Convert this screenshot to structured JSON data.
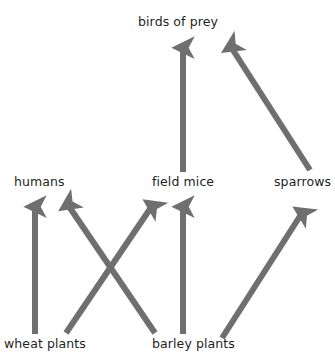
{
  "diagram": {
    "background_color": "#ffffff",
    "arrow_color": "#6f6f6f",
    "text_color": "#231f20",
    "width": 335,
    "height": 360,
    "nodes": [
      {
        "id": "birds_of_prey",
        "label": "birds of prey",
        "x": 183,
        "y": 22,
        "level": "top"
      },
      {
        "id": "humans",
        "label": "humans",
        "x": 41,
        "y": 182,
        "level": "middle"
      },
      {
        "id": "field_mice",
        "label": "field mice",
        "x": 183,
        "y": 182,
        "level": "middle"
      },
      {
        "id": "sparrows",
        "label": "sparrows",
        "x": 302,
        "y": 182,
        "level": "middle"
      },
      {
        "id": "wheat_plants",
        "label": "wheat plants",
        "x": 51,
        "y": 344,
        "level": "bottom"
      },
      {
        "id": "barley_plants",
        "label": "barley plants",
        "x": 198,
        "y": 344,
        "level": "bottom"
      }
    ],
    "arrows": [
      {
        "id": "field_mice-to-birds_of_prey",
        "from": "field_mice",
        "to": "birds_of_prey",
        "x1": 183,
        "y1": 172,
        "x2": 183,
        "y2": 39
      },
      {
        "id": "sparrows-to-birds_of_prey",
        "from": "sparrows",
        "to": "birds_of_prey",
        "x1": 310,
        "y1": 170,
        "x2": 226,
        "y2": 39
      },
      {
        "id": "wheat_plants-to-humans",
        "from": "wheat_plants",
        "to": "humans",
        "x1": 35,
        "y1": 334,
        "x2": 35,
        "y2": 198
      },
      {
        "id": "barley_plants-to-humans",
        "from": "barley_plants",
        "to": "humans",
        "x1": 155,
        "y1": 333,
        "x2": 63,
        "y2": 198
      },
      {
        "id": "wheat_plants-to-field_mice",
        "from": "wheat_plants",
        "to": "field_mice",
        "x1": 66,
        "y1": 333,
        "x2": 157,
        "y2": 198
      },
      {
        "id": "barley_plants-to-field_mice",
        "from": "barley_plants",
        "to": "field_mice",
        "x1": 183,
        "y1": 334,
        "x2": 183,
        "y2": 198
      },
      {
        "id": "barley_plants-to-sparrows",
        "from": "barley_plants",
        "to": "sparrows",
        "x1": 222,
        "y1": 338,
        "x2": 307,
        "y2": 205
      }
    ]
  }
}
